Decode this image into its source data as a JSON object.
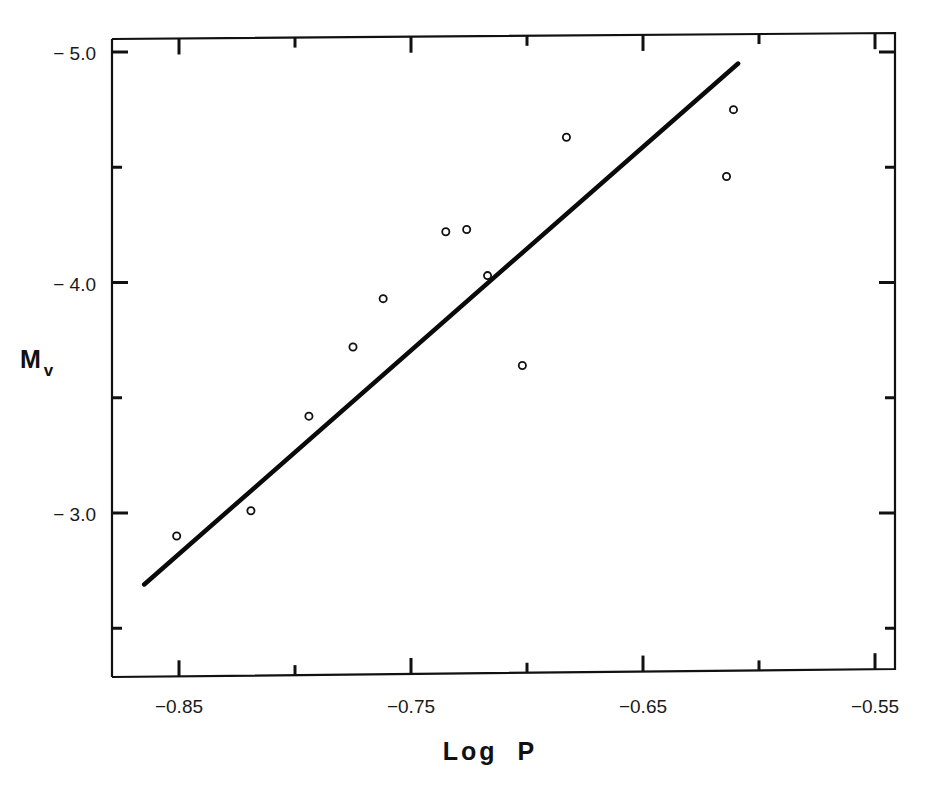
{
  "chart_data": {
    "type": "scatter",
    "title": "",
    "xlabel": "Log  P",
    "ylabel": "M",
    "ylabel_subscript": "v",
    "xlim": [
      -0.878,
      -0.541
    ],
    "ylim": [
      -2.37,
      -5.08
    ],
    "y_inverted": true,
    "grid": false,
    "legend": null,
    "x_ticks": [
      -0.85,
      -0.8,
      -0.75,
      -0.7,
      -0.65,
      -0.6,
      -0.55
    ],
    "x_tick_labels": [
      "-0.85",
      "-0.75",
      "-0.65",
      "-0.55"
    ],
    "x_tick_label_values": [
      -0.85,
      -0.75,
      -0.65,
      -0.55
    ],
    "y_ticks": [
      -5.0,
      -4.5,
      -4.0,
      -3.5,
      -3.0,
      -2.5
    ],
    "y_tick_labels": [
      "- 5.0",
      "- 4.0",
      "- 3.0"
    ],
    "y_tick_label_values": [
      -5.0,
      -4.0,
      -3.0
    ],
    "series": [
      {
        "name": "stars",
        "marker": "open-circle",
        "points": [
          {
            "x": -0.851,
            "y": -2.9
          },
          {
            "x": -0.819,
            "y": -3.01
          },
          {
            "x": -0.794,
            "y": -3.42
          },
          {
            "x": -0.775,
            "y": -3.72
          },
          {
            "x": -0.762,
            "y": -3.93
          },
          {
            "x": -0.735,
            "y": -4.22
          },
          {
            "x": -0.726,
            "y": -4.23
          },
          {
            "x": -0.717,
            "y": -4.03
          },
          {
            "x": -0.702,
            "y": -3.64
          },
          {
            "x": -0.683,
            "y": -4.63
          },
          {
            "x": -0.614,
            "y": -4.46
          },
          {
            "x": -0.611,
            "y": -4.75
          }
        ]
      },
      {
        "name": "fit",
        "type": "line",
        "points": [
          {
            "x": -0.865,
            "y": -2.69
          },
          {
            "x": -0.609,
            "y": -4.95
          }
        ]
      }
    ]
  },
  "labels": {
    "x_title": "Log  P",
    "y_title_main": "M",
    "y_title_sub": "v"
  }
}
